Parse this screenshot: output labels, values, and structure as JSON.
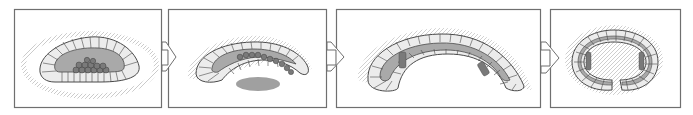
{
  "diagram": {
    "type": "sequential-stage-diagram",
    "stage_count": 4,
    "colors": {
      "frame": "#6f6f6f",
      "cell_fill": "#ececec",
      "cell_line": "#4a4a4a",
      "cavity_fill": "#a9a9a9",
      "germ_cells": "#7a7a7a",
      "cilia": "#8a8a8a",
      "background": "#ffffff"
    },
    "panels": [
      {
        "id": "stage-1",
        "x": 14,
        "y": 9,
        "w": 148,
        "h": 98,
        "description": "oval ciliated embryo with central cavity and cluster of germ cells"
      },
      {
        "id": "stage-2",
        "x": 168,
        "y": 9,
        "w": 159,
        "h": 98,
        "description": "elongated curved embryo with germ cells along cavity and separate gray mass below"
      },
      {
        "id": "stage-3",
        "x": 336,
        "y": 9,
        "w": 205,
        "h": 98,
        "description": "arched embryo bending with germ cell clusters at both ends"
      },
      {
        "id": "stage-4",
        "x": 550,
        "y": 9,
        "w": 131,
        "h": 98,
        "description": "embryo curled into ring shape with open center"
      }
    ],
    "arrows": [
      {
        "from": "stage-1",
        "to": "stage-2",
        "x": 162
      },
      {
        "from": "stage-2",
        "to": "stage-3",
        "x": 327
      },
      {
        "from": "stage-3",
        "to": "stage-4",
        "x": 541
      }
    ]
  }
}
